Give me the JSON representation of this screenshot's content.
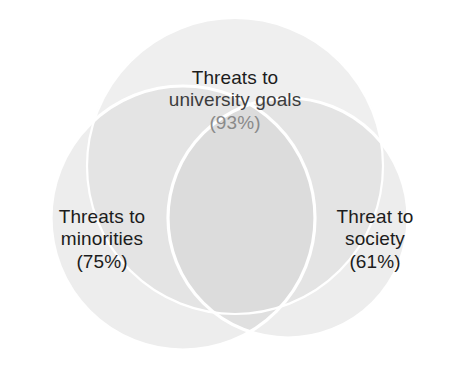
{
  "figure": {
    "type": "venn-diagram",
    "background_color": "#ffffff",
    "stroke_color": "#ffffff",
    "text_color": "#1c1c1c",
    "muted_text_color": "#8a8a8a"
  },
  "chart_data": {
    "type": "pie",
    "title": "",
    "subtitle": "",
    "xlabel": "",
    "ylabel": "",
    "diagram": "venn3",
    "legend_position": "none",
    "grid": false,
    "categories": [
      "Threats to university goals",
      "Threats to minorities",
      "Threat to society"
    ],
    "values": [
      93,
      75,
      61
    ],
    "units": "%",
    "sets": [
      {
        "id": "university-goals",
        "name": "Threats to university goals",
        "label_line_1": "Threats to",
        "label_line_2": "university goals",
        "percent": 93,
        "percent_text": "(93%)",
        "fill": "#ececec",
        "position": "top",
        "cx": 235,
        "cy": 166,
        "r": 148
      },
      {
        "id": "minorities",
        "name": "Threats to minorities",
        "label_line_1": "Threats to",
        "label_line_2": "minorities",
        "percent": 75,
        "percent_text": "(75%)",
        "fill": "#e3e3e3",
        "position": "left",
        "cx": 183,
        "cy": 218,
        "r": 132
      },
      {
        "id": "society",
        "name": "Threat to society",
        "label_line_1": "Threat to",
        "label_line_2": "society",
        "percent": 61,
        "percent_text": "(61%)",
        "fill": "#e3e3e3",
        "position": "right",
        "cx": 288,
        "cy": 218,
        "r": 120
      }
    ]
  },
  "labels": {
    "top": {
      "line_1": "Threats to",
      "line_2": "university goals",
      "percent": "(93%)"
    },
    "left": {
      "line_1": "Threats to",
      "line_2": "minorities",
      "percent": "(75%)"
    },
    "right": {
      "line_1": "Threat to",
      "line_2": "society",
      "percent": "(61%)"
    }
  }
}
